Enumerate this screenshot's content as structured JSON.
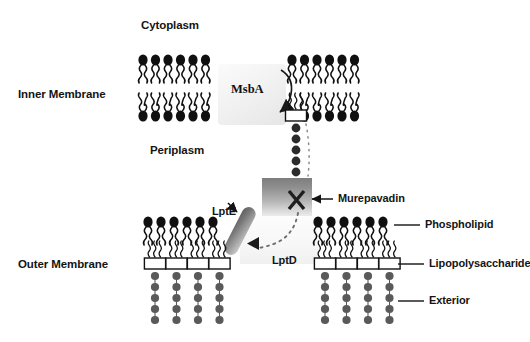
{
  "diagram": {
    "background_color": "#ffffff",
    "width": 530,
    "height": 342
  },
  "regions": {
    "cytoplasm": {
      "label": "Cytoplasm",
      "x": 141,
      "y": 19
    },
    "inner_membrane": {
      "label": "Inner Membrane",
      "x": 18,
      "y": 88
    },
    "periplasm": {
      "label": "Periplasm",
      "x": 150,
      "y": 144
    },
    "outer_membrane": {
      "label": "Outer Membrane",
      "x": 18,
      "y": 258
    }
  },
  "proteins": {
    "msba": {
      "label": "MsbA",
      "description": "inner-membrane ABC transporter flipping LPS",
      "x": 218,
      "y": 64,
      "w": 68,
      "h": 61,
      "label_x": 231,
      "label_y": 88
    },
    "lptd": {
      "label": "LptD",
      "description": "outer-membrane LPS translocon",
      "box_x": 262,
      "box_y": 178,
      "box_w": 50,
      "box_h": 38,
      "label_x": 272,
      "label_y": 258
    },
    "lpte": {
      "label": "LptE",
      "description": "lipoprotein plug of the LptD barrel",
      "label_x": 214,
      "label_y": 208
    }
  },
  "drug": {
    "label": "Murepavadin",
    "description": "antibiotic blocking LptD",
    "label_x": 340,
    "label_y": 193,
    "blocked_marker": "X",
    "arrow_from_x": 333,
    "arrow_to_x": 310,
    "arrow_y": 199
  },
  "legend": {
    "items": [
      {
        "label": "Phospholipid",
        "key": "phospholipid",
        "x": 404,
        "y": 222,
        "line_x1": 368,
        "line_x2": 398
      },
      {
        "label": "Lipopolysaccharide",
        "key": "lipopolysaccharide",
        "x": 404,
        "y": 263,
        "line_x1": 368,
        "line_x2": 398
      },
      {
        "label": "Exterior",
        "key": "exterior",
        "x": 404,
        "y": 299,
        "line_x1": 368,
        "line_x2": 398
      }
    ]
  },
  "membranes": {
    "inner": {
      "name": "inner-membrane-bilayer",
      "left_leaflet_x": 138,
      "right_leaflet_x": 287,
      "top_y": 54,
      "bottom_y": 122,
      "left_lipid_count": 6,
      "right_lipid_count": 6,
      "lipid_spacing": 12.5
    },
    "outer": {
      "name": "outer-membrane-asymmetric-bilayer",
      "left_block_x": 143,
      "right_block_x": 313,
      "phospholipid_top_y": 216,
      "lps_box_y": 258,
      "left_phospholipid_count": 6,
      "right_phospholipid_count": 6,
      "left_lps_count": 4,
      "right_lps_count": 4,
      "sugar_chain_length": 5
    }
  },
  "transported_lps": {
    "name": "lps-in-transit",
    "box_x": 286,
    "box_y": 110,
    "box_w": 20,
    "box_h": 11,
    "sugar_count": 5,
    "sugar_start_y": 126,
    "sugar_spacing": 11.5
  },
  "colors": {
    "head_black": "#101010",
    "sugar_gray": "#5a5a5a",
    "text": "#141414",
    "lps_box_fill": "#ffffff",
    "lps_box_stroke": "#111111",
    "protein_gray_dark": "#7d7d7d",
    "protein_gray_light": "#ececec"
  },
  "pathway": {
    "steps": [
      "MsbA flips LPS from inner to outer leaflet of the inner membrane",
      "LPS traverses the periplasm",
      "LptD/LptE insert LPS into the outer leaflet of the outer membrane",
      "Murepavadin blocks LptD, halting LPS insertion"
    ]
  }
}
